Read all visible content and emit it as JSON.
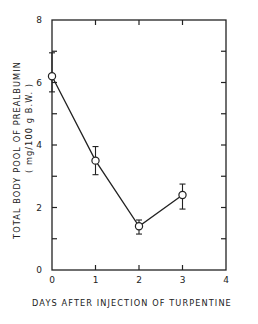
{
  "chart_data": {
    "type": "line",
    "title": "",
    "xlabel": "DAYS AFTER INJECTION OF TURPENTINE",
    "ylabel": "TOTAL BODY POOL OF PREALBUMIN",
    "ylabel_units": "( mg/100 g B.W. )",
    "xlim": [
      0,
      4
    ],
    "ylim": [
      0,
      8
    ],
    "x_ticks": [
      0,
      1,
      2,
      3,
      4
    ],
    "y_ticks": [
      0,
      2,
      4,
      6,
      8
    ],
    "y_minor_ticks": [
      1,
      3,
      5,
      7
    ],
    "grid": false,
    "legend": null,
    "series": [
      {
        "name": "Prealbumin pool",
        "marker": "open-circle",
        "x": [
          0,
          1,
          2,
          3
        ],
        "values": [
          6.2,
          3.5,
          1.4,
          2.4
        ],
        "error_upper": [
          6.95,
          3.95,
          1.6,
          2.75
        ],
        "error_lower": [
          5.7,
          3.05,
          1.15,
          1.95
        ]
      }
    ]
  },
  "colors": {
    "line": "#222222",
    "background": "#ffffff"
  }
}
